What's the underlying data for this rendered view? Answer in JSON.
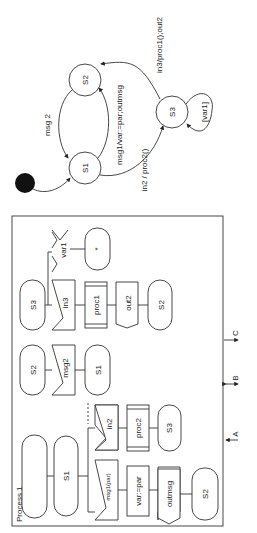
{
  "state_machine": {
    "initial_state_marker": "filled-circle",
    "states": [
      {
        "id": "S1",
        "label": "S1"
      },
      {
        "id": "S2",
        "label": "S2"
      },
      {
        "id": "S3",
        "label": "S3"
      }
    ],
    "transitions": [
      {
        "from": "S2",
        "to": "S1",
        "label": "msg 2"
      },
      {
        "from": "S1",
        "to": "S2",
        "label": "msg1/var:=par;outmsg"
      },
      {
        "from": "S1",
        "to": "S3",
        "label": "in2 / proc2()"
      },
      {
        "from": "S3",
        "to": "S2",
        "label": "in3/proc1();out2"
      },
      {
        "from": "S3",
        "to": "S3",
        "label": "[var1]"
      }
    ]
  },
  "process": {
    "title": "Process 1",
    "start_state": "",
    "s1_column": {
      "state": "S1",
      "branch_in2": {
        "input": "in2",
        "task": "proc2",
        "next": "S3"
      },
      "branch_msg1": {
        "input": "msg1(par)",
        "task": "var:=par",
        "output": "outmsg",
        "next": "S2"
      }
    },
    "s2_column": {
      "state": "S2",
      "input": "msg2",
      "next": "S1"
    },
    "s3_column": {
      "state": "S3",
      "input": "in3",
      "task": "proc1",
      "output": "out2",
      "next": "S2",
      "save": "var1",
      "asterisk_state": "*"
    },
    "arrows": [
      "A",
      "B",
      "C"
    ]
  }
}
